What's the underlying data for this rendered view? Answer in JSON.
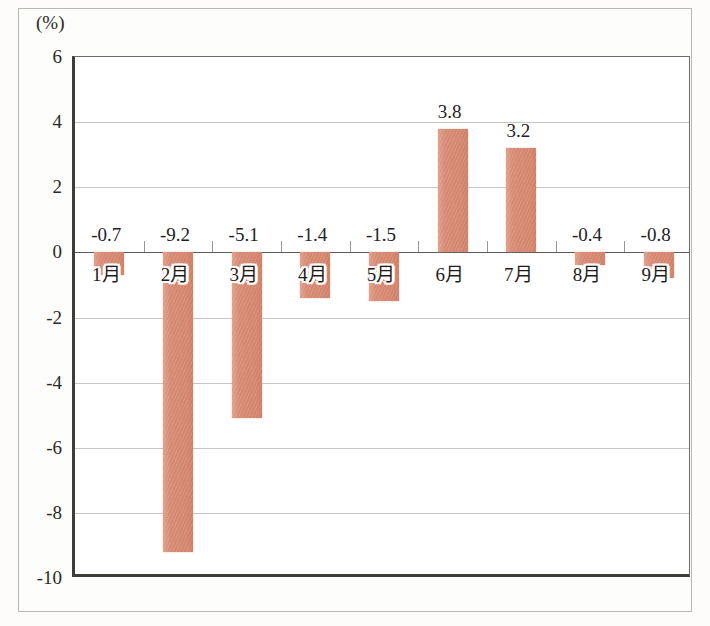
{
  "figure": {
    "unit_label": "(%)",
    "background_color": "#fdfcfa",
    "bar_color": "#d6886e",
    "grid_color": "#c8c6c1",
    "axis_color": "#3f3d3a"
  },
  "chart_data": {
    "type": "bar",
    "title": "",
    "xlabel": "",
    "ylabel": "(%)",
    "categories": [
      "1月",
      "2月",
      "3月",
      "4月",
      "5月",
      "6月",
      "7月",
      "8月",
      "9月"
    ],
    "values": [
      -0.7,
      -9.2,
      -5.1,
      -1.4,
      -1.5,
      3.8,
      3.2,
      -0.4,
      -0.8
    ],
    "value_labels": [
      "-0.7",
      "-9.2",
      "-5.1",
      "-1.4",
      "-1.5",
      "3.8",
      "3.2",
      "-0.4",
      "-0.8"
    ],
    "ylim": [
      -10,
      6
    ],
    "yticks": [
      6,
      4,
      2,
      0,
      -2,
      -4,
      -6,
      -8,
      -10
    ],
    "ytick_labels": [
      "6",
      "4",
      "2",
      "0",
      "-2",
      "-4",
      "-6",
      "-8",
      "-10"
    ],
    "grid": true,
    "legend": "none",
    "series": [
      {
        "name": "",
        "color": "#d6886e",
        "values": [
          -0.7,
          -9.2,
          -5.1,
          -1.4,
          -1.5,
          3.8,
          3.2,
          -0.4,
          -0.8
        ]
      }
    ]
  }
}
